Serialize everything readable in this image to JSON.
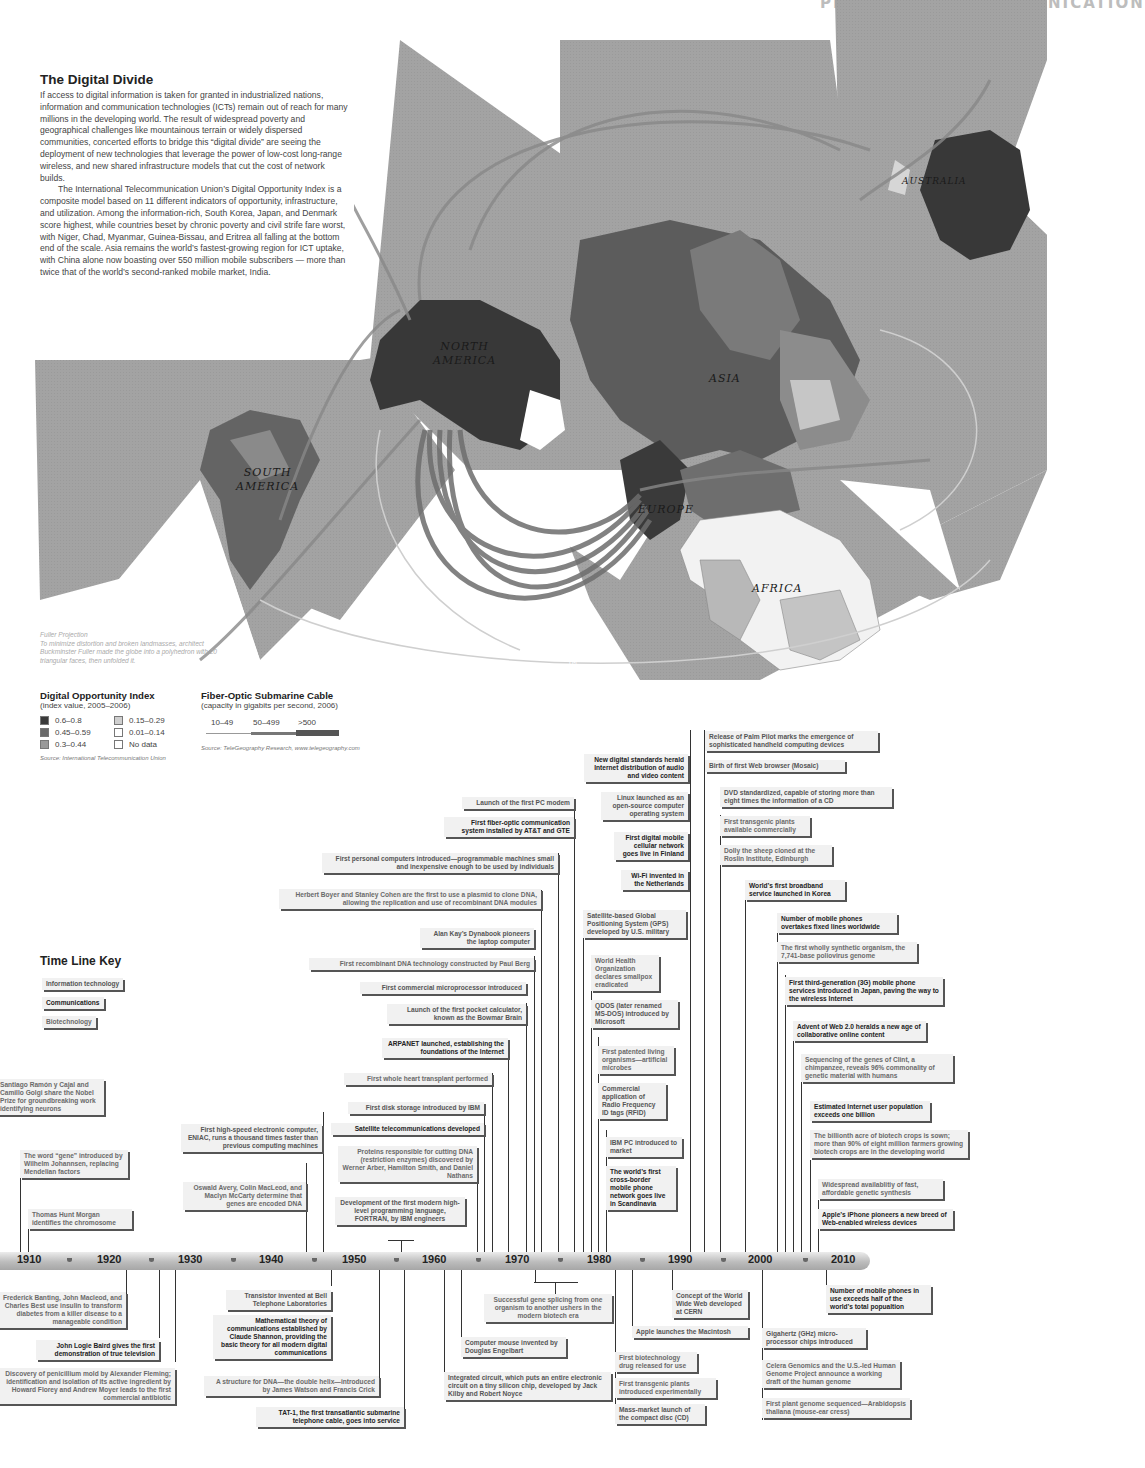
{
  "header": {
    "running_head": "PRODUCT AND COMMUNICATION",
    "page_number": "77"
  },
  "intro": {
    "title": "The Digital Divide",
    "paragraph1": "If access to digital information is taken for granted in industrialized nations, information and communication technologies (ICTs) remain out of reach for many millions in the developing world. The result of widespread poverty and geographical challenges like mountainous terrain or widely dispersed communities, concerted efforts to bridge this “digital divide” are seeing the deployment of new technologies that leverage the power of low-cost long-range wireless, and new shared infrastructure models that cut the cost of network builds.",
    "paragraph2": "The International Telecommunication Union’s Digital Opportunity Index is a composite model based on 11 different indicators of opportunity, infrastructure, and utilization. Among the information-rich, South Korea, Japan, and Denmark score highest, while countries beset by chronic poverty and civil strife fare worst, with Niger, Chad, Myanmar, Guinea-Bissau, and Eritrea all falling at the bottom end of the scale. Asia remains the world’s fastest-growing region for ICT uptake, with China alone now boasting over 550 million mobile subscribers — more than twice that of the world’s second-ranked mobile market, India."
  },
  "map": {
    "labels": {
      "north_america": "NORTH\nAMERICA",
      "south_america": "SOUTH\nAMERICA",
      "asia": "ASIA",
      "europe": "EUROPE",
      "africa": "AFRICA",
      "australia": "AUSTRALIA"
    },
    "trademark": "TM",
    "caption_title": "Fuller Projection",
    "caption_body": "To minimize distortion and broken landmasses, architect Buckminster Fuller made the globe into a polyhedron with 20 triangular faces, then unfolded it."
  },
  "legend_doi": {
    "title": "Digital Opportunity Index",
    "subtitle": "(index value, 2005–2006)",
    "items": [
      {
        "label": "0.6–0.8",
        "color": "#3a3a3a"
      },
      {
        "label": "0.45–0.59",
        "color": "#6a6a6a"
      },
      {
        "label": "0.3–0.44",
        "color": "#999999"
      },
      {
        "label": "0.15–0.29",
        "color": "#cfcfcf"
      },
      {
        "label": "0.01–0.14",
        "color": "#ffffff"
      },
      {
        "label": "No data",
        "color": "#ffffff"
      }
    ],
    "source": "Source: International Telecommunication Union"
  },
  "legend_cable": {
    "title": "Fiber-Optic Submarine Cable",
    "subtitle": "(capacity in gigabits per second, 2006)",
    "items": [
      "10–49",
      "50–499",
      ">500"
    ],
    "source": "Source: TeleGeography Research, www.telegeography.com"
  },
  "timeline_key": {
    "title": "Time Line Key",
    "items": [
      "Information technology",
      "Communications",
      "Biotechnology"
    ]
  },
  "axis": {
    "years": [
      "1910",
      "1920",
      "1930",
      "1940",
      "1950",
      "1960",
      "1970",
      "1980",
      "1990",
      "2000",
      "2010"
    ]
  },
  "events_above": [
    "Santiago Ramón y Cajal and Camillo Golgi share the Nobel Prize for groundbreaking work identifying neurons",
    "The word “gene” introduced by Wilhelm Johannsen, replacing Mendelian factors",
    "Thomas Hunt Morgan identifies the chromosome",
    "First high-speed electronic computer, ENIAC, runs a thousand times faster than previous computing machines",
    "Oswald Avery, Colin MacLeod, and Maclyn McCarty determine that genes are encoded DNA",
    "Launch of the first PC modem",
    "First fiber-optic communication system installed by AT&T and GTE",
    "First personal computers introduced—programmable machines small and inexpensive enough to be used by individuals",
    "Herbert Boyer and Stanley Cohen are the first to use a plasmid to clone DNA, allowing the replication and use of recombinant DNA modules",
    "Alan Kay’s Dynabook pioneers the laptop computer",
    "First recombinant DNA technology constructed by Paul Berg",
    "First commercial microprocessor introduced",
    "Launch of the first pocket calculator, known as the Bowmar Brain",
    "ARPANET launched, establishing the foundations of the Internet",
    "First whole heart transplant performed",
    "First disk storage introduced by IBM",
    "Satellite telecommunications developed",
    "Proteins responsible for cutting DNA (restriction enzymes) discovered by Werner Arber, Hamilton Smith, and Daniel Nathans",
    "Development of the first modern high-level programming language, FORTRAN, by IBM engineers",
    "New digital standards herald Internet distribution of audio and video content",
    "Linux launched as an open-source computer operating system",
    "First digital mobile cellular network goes live in Finland",
    "Wi-Fi invented in the Netherlands",
    "Satellite-based Global Positioning System (GPS) developed by U.S. military",
    "World Health Organization declares smallpox eradicated",
    "QDOS (later renamed MS-DOS) introduced by Microsoft",
    "First patented living organisms—artificial microbes",
    "Commercial application of Radio Frequency ID tags (RFID)",
    "IBM PC introduced to market",
    "The world’s first cross-border mobile phone network goes live in Scandinavia",
    "Release of Palm Pilot marks the emergence of sophisticated handheld computing devices",
    "Birth of first Web browser (Mosaic)",
    "DVD standardized, capable of storing more than eight times the information of a CD",
    "First transgenic plants available commercially",
    "Dolly the sheep cloned at the Roslin Institute, Edinburgh",
    "World’s first broadband service launched in Korea",
    "Number of mobile phones overtakes fixed lines worldwide",
    "The first wholly synthetic organism, the 7,741-base poliovirus genome",
    "First third-generation (3G) mobile phone services introduced in Japan, paving the way to the wireless Internet",
    "Advent of Web 2.0 heralds a new age of collaborative online content",
    "Sequencing of the genes of Clint, a chimpanzee, reveals 96% commonality of genetic material with humans",
    "Estimated Internet user population exceeds one billion",
    "The billionth acre of biotech crops is sown; more than 90% of eight million farmers growing biotech crops are in the developing world",
    "Widespread availablitiy of fast, affordable genetic synthesis",
    "Apple’s iPhone pioneers a new breed of Web-enabled wireless devices"
  ],
  "events_below": [
    "Frederick Banting, John Macleod, and Charles Best use insulin to transform diabetes from a killer disease to a manageable condition",
    "John Logie Baird gives the first demonstration of true television",
    "Discovery of penicillium mold by Alexander Fleming; identification and isolation of its active ingredient by Howard Florey and Andrew Moyer leads to the first commercial antibiotic",
    "Transistor invented at Bell Telephone Laboratories",
    "Mathematical theory of communications established by Claude Shannon, providing the basic theory for all modern digital communications",
    "A structure for DNA—the double helix—introduced by James Watson and Francis Crick",
    "TAT-1, the first transatlantic submarine telephone cable, goes into service",
    "Successful gene splicing from one organism to another ushers in the modern biotech era",
    "Computer mouse invented by Douglas Engelbart",
    "Integrated circuit, which puts an entire electronic circuit on a tiny silicon chip, developed by Jack Kilby and Robert Noyce",
    "Concept of the World Wide Web developed at CERN",
    "Apple launches the Macintosh",
    "First biotechnology drug released for use",
    "First transgenic plants introduced experimentally",
    "Mass-market launch of the compact disc (CD)",
    "Number of mobile phones in use exceeds half of the world’s total popualtion",
    "Gigahertz (GHz) micro-processor chips introduced",
    "Celera Genomics and the U.S.-led Human Genome Project announce a working draft of the human genome",
    "First plant genome sequenced—Arabidopsis thaliana (mouse-ear cress)"
  ]
}
